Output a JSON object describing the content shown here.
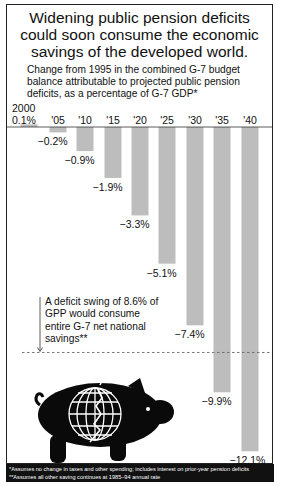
{
  "header": {
    "title_lines": [
      "Widening public pension deficits",
      "could soon consume the economic",
      "savings of the developed world."
    ],
    "subtitle": "Change from 1995 in the combined G-7 budget balance attributable to projected public pension deficits, as a percentage of G-7 GDP*"
  },
  "annotation": {
    "text": "A deficit swing of 8.6% of GPP would consume entire G-7 net national savings**",
    "threshold": -8.6
  },
  "footnotes": [
    "*Assumes no change in taxes and other spending; includes interest on prior-year pension deficits",
    "**Assumes all other saving continues at 1985–94 annual rate"
  ],
  "colors": {
    "bar": "#bdbdbd",
    "text": "#111111",
    "footer_bg": "#111111",
    "pig": "#0a0a0a"
  },
  "illustration": "piggy-bank-with-cracked-globe",
  "chart_data": {
    "type": "bar",
    "title": "Widening public pension deficits could soon consume the economic savings of the developed world.",
    "subtitle": "Change from 1995 in the combined G-7 budget balance attributable to projected public pension deficits, as a percentage of G-7 GDP*",
    "categories": [
      "2000",
      "'05",
      "'10",
      "'15",
      "'20",
      "'25",
      "'30",
      "'35",
      "'40"
    ],
    "values": [
      0.1,
      -0.2,
      -0.9,
      -1.9,
      -3.3,
      -5.1,
      -7.4,
      -9.9,
      -12.1
    ],
    "value_labels": [
      "0.1%",
      "−0.2%",
      "−0.9%",
      "−1.9%",
      "−3.3%",
      "−5.1%",
      "−7.4%",
      "−9.9%",
      "−12.1%"
    ],
    "xlabel": "",
    "ylabel": "% of G-7 GDP",
    "ylim": [
      -12.5,
      0.5
    ],
    "grid": false,
    "legend": null,
    "reference_lines": [
      {
        "value": -8.6,
        "style": "dashed",
        "label": "A deficit swing of 8.6% of GPP would consume entire G-7 net national savings**"
      }
    ]
  }
}
